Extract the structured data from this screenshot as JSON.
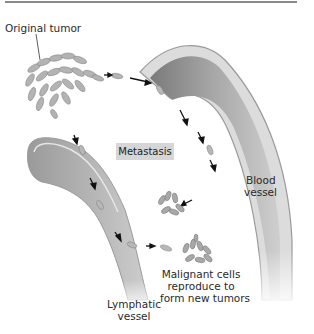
{
  "figure": {
    "title": "Metastasis",
    "labels": {
      "original_tumor": "Original tumor",
      "blood_vessel_line1": "Blood",
      "blood_vessel_line2": "vessel",
      "lymphatic_line1": "Lymphatic",
      "lymphatic_line2": "vessel",
      "malignant_line1": "Malignant cells",
      "malignant_line2": "reproduce to",
      "malignant_line3": "form new tumors"
    },
    "colors": {
      "rule": "#8a8a8a",
      "vessel_wall": "#bdbdbd",
      "vessel_lumen": "#8c8c8c",
      "cells": "#a9a9a9",
      "arrows": "#111111",
      "badge_bg": "#d6d6d6"
    }
  }
}
